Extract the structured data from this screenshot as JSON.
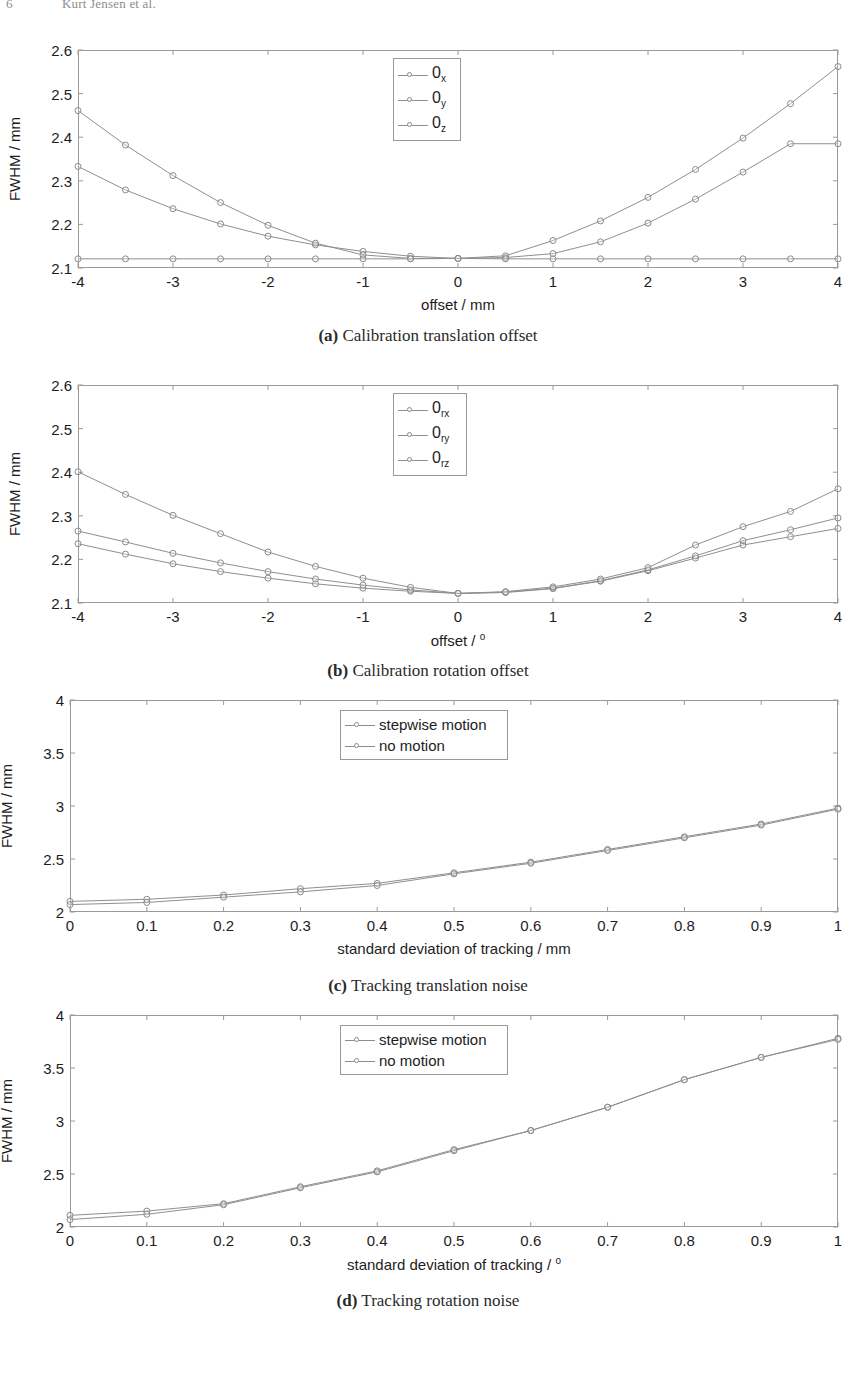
{
  "header": {
    "folio": "6",
    "running_title": "Kurt Jensen et al."
  },
  "figures": [
    {
      "id": "fig-a",
      "caption_label": "(a)",
      "caption_text": "Calibration translation offset",
      "chart_data": {
        "type": "line",
        "title": "",
        "xlabel": "offset / mm",
        "ylabel": "FWHM / mm",
        "xlim": [
          -4,
          4
        ],
        "ylim": [
          2.1,
          2.6
        ],
        "xticks": [
          "-4",
          "-3",
          "-2",
          "-1",
          "0",
          "1",
          "2",
          "3",
          "4"
        ],
        "xtick_values": [
          -4,
          -3,
          -2,
          -1,
          0,
          1,
          2,
          3,
          4
        ],
        "yticks": [
          "2.1",
          "2.2",
          "2.3",
          "2.4",
          "2.5",
          "2.6"
        ],
        "ytick_values": [
          2.1,
          2.2,
          2.3,
          2.4,
          2.5,
          2.6
        ],
        "grid": false,
        "legend_position": "top-center",
        "x": [
          -4,
          -3.5,
          -3,
          -2.5,
          -2,
          -1.5,
          -1,
          -0.5,
          0,
          0.5,
          1,
          1.5,
          2,
          2.5,
          3,
          3.5,
          4
        ],
        "series": [
          {
            "name": "0x",
            "legend_base": "0",
            "legend_sub": "x",
            "values": [
              2.333,
              2.279,
              2.236,
              2.201,
              2.173,
              2.153,
              2.138,
              2.127,
              2.122,
              2.124,
              2.133,
              2.16,
              2.203,
              2.258,
              2.32,
              2.385,
              2.385
            ]
          },
          {
            "name": "0y",
            "legend_base": "0",
            "legend_sub": "y",
            "values": [
              2.461,
              2.382,
              2.312,
              2.25,
              2.198,
              2.157,
              2.13,
              2.122,
              2.122,
              2.128,
              2.163,
              2.208,
              2.262,
              2.326,
              2.398,
              2.477,
              2.562
            ]
          },
          {
            "name": "0z",
            "legend_base": "0",
            "legend_sub": "z",
            "values": [
              2.121,
              2.121,
              2.121,
              2.121,
              2.121,
              2.121,
              2.121,
              2.121,
              2.122,
              2.121,
              2.121,
              2.121,
              2.121,
              2.121,
              2.121,
              2.121,
              2.121
            ]
          }
        ]
      }
    },
    {
      "id": "fig-b",
      "caption_label": "(b)",
      "caption_text": "Calibration rotation offset",
      "chart_data": {
        "type": "line",
        "title": "",
        "xlabel": "offset / °",
        "xlabel_base": "offset / ",
        "xlabel_sup": "o",
        "ylabel": "FWHM / mm",
        "xlim": [
          -4,
          4
        ],
        "ylim": [
          2.1,
          2.6
        ],
        "xticks": [
          "-4",
          "-3",
          "-2",
          "-1",
          "0",
          "1",
          "2",
          "3",
          "4"
        ],
        "xtick_values": [
          -4,
          -3,
          -2,
          -1,
          0,
          1,
          2,
          3,
          4
        ],
        "yticks": [
          "2.1",
          "2.2",
          "2.3",
          "2.4",
          "2.5",
          "2.6"
        ],
        "ytick_values": [
          2.1,
          2.2,
          2.3,
          2.4,
          2.5,
          2.6
        ],
        "grid": false,
        "legend_position": "top-center",
        "x": [
          -4,
          -3.5,
          -3,
          -2.5,
          -2,
          -1.5,
          -1,
          -0.5,
          0,
          0.5,
          1,
          1.5,
          2,
          2.5,
          3,
          3.5,
          4
        ],
        "series": [
          {
            "name": "0rx",
            "legend_base": "0",
            "legend_sub": "rx",
            "values": [
              2.236,
              2.212,
              2.19,
              2.172,
              2.157,
              2.144,
              2.134,
              2.127,
              2.122,
              2.124,
              2.133,
              2.15,
              2.174,
              2.203,
              2.233,
              2.252,
              2.271
            ]
          },
          {
            "name": "0ry",
            "legend_base": "0",
            "legend_sub": "ry",
            "values": [
              2.265,
              2.24,
              2.214,
              2.192,
              2.172,
              2.155,
              2.141,
              2.13,
              2.122,
              2.125,
              2.134,
              2.151,
              2.176,
              2.208,
              2.243,
              2.268,
              2.295
            ]
          },
          {
            "name": "0rz",
            "legend_base": "0",
            "legend_sub": "rz",
            "values": [
              2.401,
              2.349,
              2.301,
              2.259,
              2.217,
              2.184,
              2.157,
              2.136,
              2.122,
              2.126,
              2.137,
              2.155,
              2.181,
              2.233,
              2.275,
              2.31,
              2.362
            ]
          }
        ]
      }
    },
    {
      "id": "fig-c",
      "caption_label": "(c)",
      "caption_text": "Tracking translation noise",
      "chart_data": {
        "type": "line",
        "title": "",
        "xlabel": "standard deviation of tracking / mm",
        "ylabel": "FWHM / mm",
        "xlim": [
          0,
          1
        ],
        "ylim": [
          2,
          4
        ],
        "xticks": [
          "0",
          "0.1",
          "0.2",
          "0.3",
          "0.4",
          "0.5",
          "0.6",
          "0.7",
          "0.8",
          "0.9",
          "1"
        ],
        "xtick_values": [
          0,
          0.1,
          0.2,
          0.3,
          0.4,
          0.5,
          0.6,
          0.7,
          0.8,
          0.9,
          1
        ],
        "yticks": [
          "2",
          "2.5",
          "3",
          "3.5",
          "4"
        ],
        "ytick_values": [
          2,
          2.5,
          3,
          3.5,
          4
        ],
        "grid": false,
        "legend_position": "top-center",
        "x": [
          0,
          0.1,
          0.2,
          0.3,
          0.4,
          0.5,
          0.6,
          0.7,
          0.8,
          0.9,
          1
        ],
        "series": [
          {
            "name": "stepwise motion",
            "values": [
              2.1,
              2.12,
              2.16,
              2.22,
              2.27,
              2.37,
              2.47,
              2.59,
              2.71,
              2.83,
              2.98
            ]
          },
          {
            "name": "no motion",
            "values": [
              2.07,
              2.09,
              2.14,
              2.19,
              2.25,
              2.36,
              2.46,
              2.58,
              2.7,
              2.82,
              2.97
            ]
          }
        ]
      }
    },
    {
      "id": "fig-d",
      "caption_label": "(d)",
      "caption_text": "Tracking rotation noise",
      "chart_data": {
        "type": "line",
        "title": "",
        "xlabel": "standard deviation of tracking / °",
        "xlabel_base": "standard deviation of tracking / ",
        "xlabel_sup": "o",
        "ylabel": "FWHM / mm",
        "xlim": [
          0,
          1
        ],
        "ylim": [
          2,
          4
        ],
        "xticks": [
          "0",
          "0.1",
          "0.2",
          "0.3",
          "0.4",
          "0.5",
          "0.6",
          "0.7",
          "0.8",
          "0.9",
          "1"
        ],
        "xtick_values": [
          0,
          0.1,
          0.2,
          0.3,
          0.4,
          0.5,
          0.6,
          0.7,
          0.8,
          0.9,
          1
        ],
        "yticks": [
          "2",
          "2.5",
          "3",
          "3.5",
          "4"
        ],
        "ytick_values": [
          2,
          2.5,
          3,
          3.5,
          4
        ],
        "grid": false,
        "legend_position": "top-center",
        "x": [
          0,
          0.1,
          0.2,
          0.3,
          0.4,
          0.5,
          0.6,
          0.7,
          0.8,
          0.9,
          1
        ],
        "series": [
          {
            "name": "stepwise motion",
            "values": [
              2.11,
              2.15,
              2.22,
              2.38,
              2.53,
              2.73,
              2.91,
              3.13,
              3.39,
              3.6,
              3.78
            ]
          },
          {
            "name": "no motion",
            "values": [
              2.07,
              2.12,
              2.21,
              2.37,
              2.52,
              2.72,
              2.91,
              3.13,
              3.39,
              3.6,
              3.77
            ]
          }
        ]
      }
    }
  ],
  "style": {
    "line_color": "#8f8f8f",
    "marker_color": "#8a8a8a",
    "axis_color": "#9a9a9a",
    "text_color": "#1d1d1d"
  }
}
